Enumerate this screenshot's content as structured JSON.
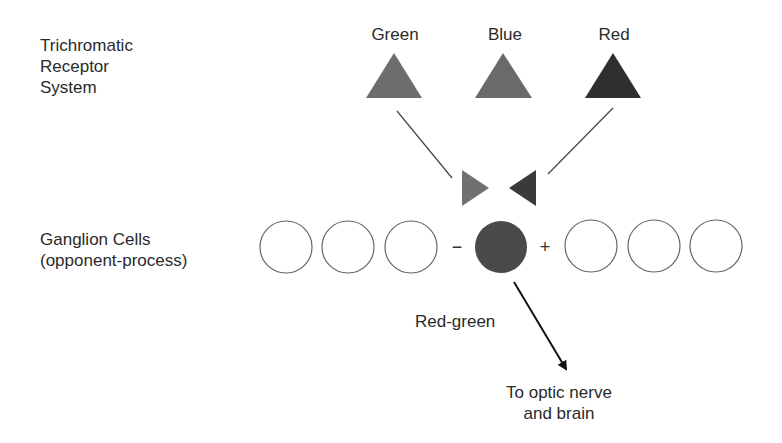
{
  "diagram": {
    "receptor_label": [
      "Trichromatic",
      "Receptor",
      "System"
    ],
    "ganglion_label": [
      "Ganglion Cells",
      "(opponent-process)"
    ],
    "receptors": [
      {
        "name": "Green",
        "color": "#6e6e6e"
      },
      {
        "name": "Blue",
        "color": "#6a6a6a"
      },
      {
        "name": "Red",
        "color": "#2f2f2f"
      }
    ],
    "inputs": [
      {
        "from": "Green",
        "color": "#707070"
      },
      {
        "from": "Red",
        "color": "#3a3a3a"
      }
    ],
    "signs": {
      "minus": "−",
      "plus": "+"
    },
    "active_cell_color": "#4a4a4a",
    "output_label": "Red-green",
    "destination_label": [
      "To optic nerve",
      "and brain"
    ]
  }
}
